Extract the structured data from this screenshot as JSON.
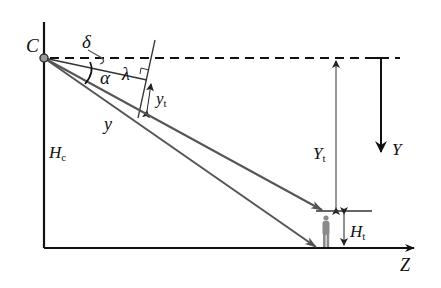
{
  "diagram": {
    "labels": {
      "camera": "C",
      "tilt": "δ",
      "angle": "α",
      "focal": "λ",
      "image_offset_main": "y",
      "image_offset_sub": "t",
      "ray": "y",
      "camera_height_main": "H",
      "camera_height_sub": "c",
      "target_distance_main": "Y",
      "target_distance_sub": "t",
      "y_axis": "Y",
      "target_height_main": "H",
      "target_height_sub": "t",
      "z_axis": "Z"
    },
    "colors": {
      "axis": "#111111",
      "ray": "#555555",
      "person": "#8a8a8a"
    }
  }
}
